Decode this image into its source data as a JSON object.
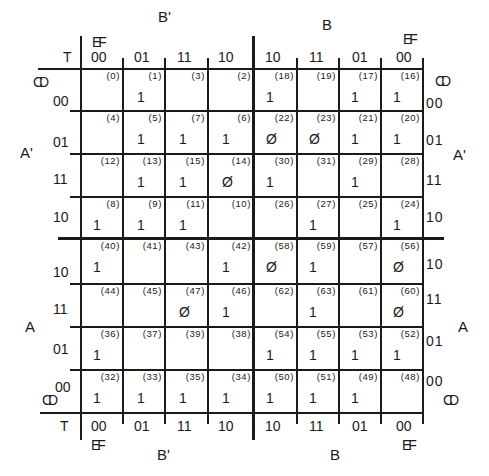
{
  "labels": {
    "top_left_var": "B'",
    "top_right_var": "B",
    "bottom_left_var": "B'",
    "bottom_right_var": "B",
    "left_top_var": "A'",
    "left_bottom_var": "A",
    "right_top_var": "A'",
    "right_bottom_var": "A",
    "ef": "EF",
    "cd": "CD",
    "t": "T"
  },
  "column_headers": [
    "00",
    "01",
    "11",
    "10",
    "10",
    "11",
    "01",
    "00"
  ],
  "row_headers": [
    "00",
    "01",
    "11",
    "10",
    "10",
    "11",
    "01",
    "00"
  ],
  "grid": [
    [
      {
        "i": "(0)",
        "v": ""
      },
      {
        "i": "(1)",
        "v": "1"
      },
      {
        "i": "(3)",
        "v": ""
      },
      {
        "i": "(2)",
        "v": ""
      },
      {
        "i": "(18)",
        "v": "1"
      },
      {
        "i": "(19)",
        "v": ""
      },
      {
        "i": "(17)",
        "v": "1"
      },
      {
        "i": "(16)",
        "v": "1"
      }
    ],
    [
      {
        "i": "(4)",
        "v": ""
      },
      {
        "i": "(5)",
        "v": "1"
      },
      {
        "i": "(7)",
        "v": "1"
      },
      {
        "i": "(6)",
        "v": "1"
      },
      {
        "i": "(22)",
        "v": "Ø"
      },
      {
        "i": "(23)",
        "v": "Ø"
      },
      {
        "i": "(21)",
        "v": "1"
      },
      {
        "i": "(20)",
        "v": "1"
      }
    ],
    [
      {
        "i": "(12)",
        "v": ""
      },
      {
        "i": "(13)",
        "v": "1"
      },
      {
        "i": "(15)",
        "v": "1"
      },
      {
        "i": "(14)",
        "v": "Ø"
      },
      {
        "i": "(30)",
        "v": "1"
      },
      {
        "i": "(31)",
        "v": ""
      },
      {
        "i": "(29)",
        "v": "1"
      },
      {
        "i": "(28)",
        "v": ""
      }
    ],
    [
      {
        "i": "(8)",
        "v": "1"
      },
      {
        "i": "(9)",
        "v": "1"
      },
      {
        "i": "(11)",
        "v": "1"
      },
      {
        "i": "(10)",
        "v": ""
      },
      {
        "i": "(26)",
        "v": ""
      },
      {
        "i": "(27)",
        "v": "1"
      },
      {
        "i": "(25)",
        "v": ""
      },
      {
        "i": "(24)",
        "v": "1"
      }
    ],
    [
      {
        "i": "(40)",
        "v": "1"
      },
      {
        "i": "(41)",
        "v": ""
      },
      {
        "i": "(43)",
        "v": ""
      },
      {
        "i": "(42)",
        "v": "1"
      },
      {
        "i": "(58)",
        "v": "Ø"
      },
      {
        "i": "(59)",
        "v": "1"
      },
      {
        "i": "(57)",
        "v": ""
      },
      {
        "i": "(56)",
        "v": "Ø"
      }
    ],
    [
      {
        "i": "(44)",
        "v": ""
      },
      {
        "i": "(45)",
        "v": ""
      },
      {
        "i": "(47)",
        "v": "Ø"
      },
      {
        "i": "(46)",
        "v": "1"
      },
      {
        "i": "(62)",
        "v": ""
      },
      {
        "i": "(63)",
        "v": "1"
      },
      {
        "i": "(61)",
        "v": ""
      },
      {
        "i": "(60)",
        "v": "Ø"
      }
    ],
    [
      {
        "i": "(36)",
        "v": "1"
      },
      {
        "i": "(37)",
        "v": ""
      },
      {
        "i": "(39)",
        "v": ""
      },
      {
        "i": "(38)",
        "v": ""
      },
      {
        "i": "(54)",
        "v": "1"
      },
      {
        "i": "(55)",
        "v": "1"
      },
      {
        "i": "(53)",
        "v": "1"
      },
      {
        "i": "(52)",
        "v": "1"
      }
    ],
    [
      {
        "i": "(32)",
        "v": "1"
      },
      {
        "i": "(33)",
        "v": "1"
      },
      {
        "i": "(35)",
        "v": "1"
      },
      {
        "i": "(34)",
        "v": "1"
      },
      {
        "i": "(50)",
        "v": "1"
      },
      {
        "i": "(51)",
        "v": "1"
      },
      {
        "i": "(49)",
        "v": "1"
      },
      {
        "i": "(48)",
        "v": ""
      }
    ]
  ]
}
